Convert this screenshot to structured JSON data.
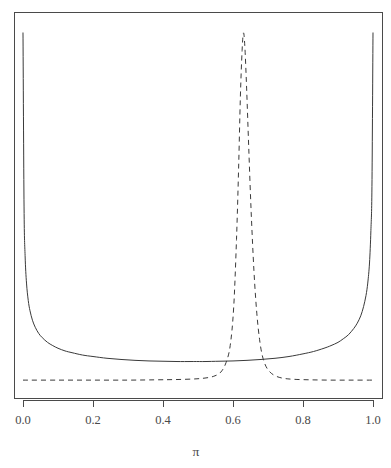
{
  "chart_data": {
    "type": "line",
    "title": "",
    "subtitle": "",
    "xlabel": "π",
    "ylabel": "",
    "xlim": [
      0.0,
      1.0
    ],
    "ylim": [
      0,
      12
    ],
    "grid": false,
    "legend": "none",
    "background": "#ffffff",
    "line_color": "#3a3a3a",
    "axis_color": "#4a4a4a",
    "xticks": [
      0.0,
      0.2,
      0.4,
      0.6,
      0.8,
      1.0
    ],
    "xticklabels": [
      "0.0",
      "0.2",
      "0.4",
      "0.6",
      "0.8",
      "1.0"
    ],
    "yticks": [],
    "yticklabels": [],
    "series": [
      {
        "name": "prior",
        "style": "solid",
        "x": [
          0.0,
          0.003,
          0.006,
          0.01,
          0.015,
          0.02,
          0.027,
          0.035,
          0.045,
          0.055,
          0.07,
          0.085,
          0.1,
          0.12,
          0.14,
          0.17,
          0.2,
          0.24,
          0.28,
          0.32,
          0.36,
          0.4,
          0.44,
          0.48,
          0.5,
          0.52,
          0.56,
          0.6,
          0.64,
          0.68,
          0.72,
          0.76,
          0.8,
          0.83,
          0.86,
          0.88,
          0.9,
          0.915,
          0.93,
          0.945,
          0.955,
          0.965,
          0.973,
          0.98,
          0.985,
          0.99,
          0.994,
          0.997,
          1.0
        ],
        "y": [
          11.8,
          5.9,
          4.25,
          3.32,
          2.73,
          2.38,
          2.06,
          1.82,
          1.61,
          1.47,
          1.31,
          1.2,
          1.11,
          1.02,
          0.96,
          0.88,
          0.83,
          0.77,
          0.73,
          0.7,
          0.68,
          0.67,
          0.66,
          0.66,
          0.66,
          0.66,
          0.67,
          0.68,
          0.7,
          0.73,
          0.77,
          0.83,
          0.92,
          1.0,
          1.11,
          1.2,
          1.31,
          1.43,
          1.57,
          1.78,
          1.96,
          2.21,
          2.52,
          2.9,
          3.32,
          4.0,
          5.1,
          6.6,
          11.8
        ]
      },
      {
        "name": "posterior",
        "style": "dashed",
        "x": [
          0.0,
          0.1,
          0.2,
          0.3,
          0.38,
          0.44,
          0.49,
          0.52,
          0.545,
          0.565,
          0.58,
          0.592,
          0.602,
          0.61,
          0.616,
          0.621,
          0.626,
          0.63,
          0.634,
          0.639,
          0.645,
          0.652,
          0.66,
          0.668,
          0.676,
          0.684,
          0.694,
          0.706,
          0.72,
          0.74,
          0.77,
          0.82,
          0.88,
          0.94,
          1.0
        ],
        "y": [
          0.03,
          0.03,
          0.03,
          0.03,
          0.04,
          0.05,
          0.07,
          0.1,
          0.16,
          0.3,
          0.62,
          1.2,
          2.5,
          4.8,
          7.2,
          9.6,
          11.2,
          11.8,
          11.3,
          9.9,
          7.9,
          5.7,
          3.7,
          2.3,
          1.4,
          0.85,
          0.5,
          0.3,
          0.18,
          0.1,
          0.06,
          0.04,
          0.03,
          0.03,
          0.03
        ]
      }
    ]
  },
  "layout": {
    "plot_left": 14,
    "plot_right": 382,
    "plot_top": 12,
    "plot_bottom": 398,
    "axis_y": 400,
    "tick_length": 7,
    "tick_label_y": 424,
    "axis_title_y": 456,
    "axis_title_x": 196
  }
}
